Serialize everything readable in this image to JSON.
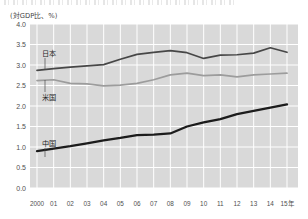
{
  "unit_label": "(対GDP比、%)",
  "x_axis_suffix": "年",
  "colors": {
    "plot_background": "#d9d9d9",
    "gridline": "#ffffff",
    "japan": "#474747",
    "usa": "#9c9c9c",
    "china": "#1c1c1c",
    "text": "#4f4f4f"
  },
  "chart_data": {
    "type": "line",
    "title": "",
    "xlabel": "年",
    "ylabel": "(対GDP比、%)",
    "ylim": [
      0.0,
      4.0
    ],
    "yticks": [
      0.0,
      0.5,
      1.0,
      1.5,
      2.0,
      2.5,
      3.0,
      3.5,
      4.0
    ],
    "ytick_labels": [
      "0.0",
      "0.5",
      "1.0",
      "1.5",
      "2.0",
      "2.5",
      "3.0",
      "3.5",
      "4.0"
    ],
    "grid": true,
    "legend_position": "inline-labels",
    "categories": [
      2000,
      2001,
      2002,
      2003,
      2004,
      2005,
      2006,
      2007,
      2008,
      2009,
      2010,
      2011,
      2012,
      2013,
      2014,
      2015
    ],
    "xtick_labels": [
      "2000",
      "01",
      "02",
      "03",
      "04",
      "05",
      "06",
      "07",
      "08",
      "09",
      "10",
      "11",
      "12",
      "13",
      "14",
      "15年"
    ],
    "series": [
      {
        "name": "日本",
        "key": "japan",
        "color": "#474747",
        "width": 1.7,
        "label_x": 42,
        "label_y": 56,
        "values": [
          2.87,
          2.91,
          2.95,
          2.98,
          3.01,
          3.14,
          3.26,
          3.31,
          3.35,
          3.3,
          3.16,
          3.24,
          3.25,
          3.29,
          3.42,
          3.31
        ]
      },
      {
        "name": "米国",
        "key": "usa",
        "color": "#9c9c9c",
        "width": 1.7,
        "label_x": 42,
        "label_y": 100,
        "values": [
          2.62,
          2.64,
          2.55,
          2.54,
          2.49,
          2.51,
          2.55,
          2.64,
          2.76,
          2.8,
          2.74,
          2.76,
          2.71,
          2.76,
          2.78,
          2.8
        ]
      },
      {
        "name": "中国",
        "key": "china",
        "color": "#1c1c1c",
        "width": 2.3,
        "label_x": 42,
        "label_y": 146,
        "values": [
          0.9,
          0.96,
          1.02,
          1.09,
          1.16,
          1.22,
          1.29,
          1.3,
          1.33,
          1.5,
          1.6,
          1.68,
          1.8,
          1.88,
          1.96,
          2.04
        ]
      }
    ]
  }
}
